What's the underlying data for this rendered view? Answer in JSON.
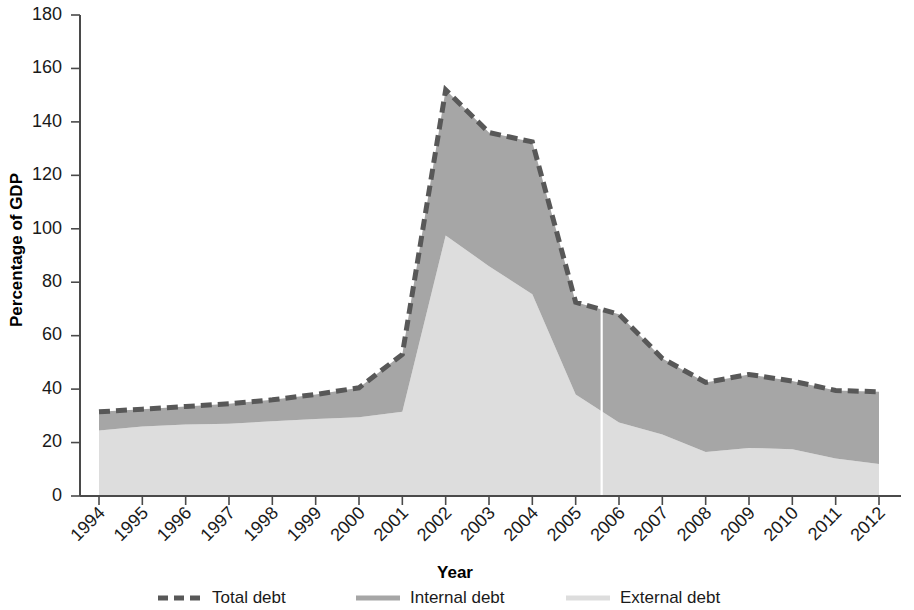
{
  "chart_data": {
    "type": "area",
    "stacked": true,
    "title": "",
    "xlabel": "Year",
    "ylabel": "Percentage of GDP",
    "xlim": [
      1994,
      2012
    ],
    "ylim": [
      0,
      180
    ],
    "ytick_step": 20,
    "grid": false,
    "legend_position": "bottom",
    "categories": [
      "1994",
      "1995",
      "1996",
      "1997",
      "1998",
      "1999",
      "2000",
      "2001",
      "2002",
      "2003",
      "2004",
      "2005",
      "2006",
      "2007",
      "2008",
      "2009",
      "2010",
      "2011",
      "2012"
    ],
    "x": [
      1994,
      1995,
      1996,
      1997,
      1998,
      1999,
      2000,
      2001,
      2002,
      2003,
      2004,
      2005,
      2006,
      2007,
      2008,
      2009,
      2010,
      2011,
      2012
    ],
    "yticks": [
      0,
      20,
      40,
      60,
      80,
      100,
      120,
      140,
      160,
      180
    ],
    "series": [
      {
        "name": "External debt",
        "color": "#dddddd",
        "stack_order": 0,
        "values": [
          24.5,
          26.0,
          26.8,
          27.0,
          28.0,
          28.8,
          29.5,
          31.5,
          97.5,
          86.0,
          75.5,
          38.0,
          27.5,
          23.0,
          16.5,
          18.0,
          17.5,
          14.0,
          12.0
        ]
      },
      {
        "name": "Internal debt",
        "color": "#a6a6a6",
        "stack_order": 1,
        "values": [
          7.0,
          6.5,
          6.7,
          7.5,
          8.0,
          9.2,
          11.0,
          21.5,
          54.5,
          50.0,
          57.0,
          34.5,
          40.5,
          28.5,
          26.0,
          27.5,
          25.5,
          25.5,
          27.0
        ]
      }
    ],
    "total_series": {
      "name": "Total debt",
      "color": "#585858",
      "style": "dashed",
      "values": [
        31.5,
        32.5,
        33.5,
        34.5,
        36.0,
        38.0,
        40.5,
        53.0,
        152.0,
        136.0,
        132.5,
        72.5,
        68.0,
        51.5,
        42.5,
        45.5,
        43.0,
        39.5,
        39.0
      ]
    },
    "annotations": [
      {
        "type": "vertical-line",
        "x": 2005.6,
        "color": "#ffffff",
        "label": ""
      }
    ]
  },
  "legend": {
    "items": [
      {
        "label": "Total debt",
        "marker": "dashed-line",
        "color": "#585858"
      },
      {
        "label": "Internal debt",
        "marker": "solid-line",
        "color": "#a6a6a6"
      },
      {
        "label": "External debt",
        "marker": "solid-line",
        "color": "#dddddd"
      }
    ]
  },
  "axes": {
    "y_title": "Percentage of GDP",
    "x_title": "Year"
  }
}
